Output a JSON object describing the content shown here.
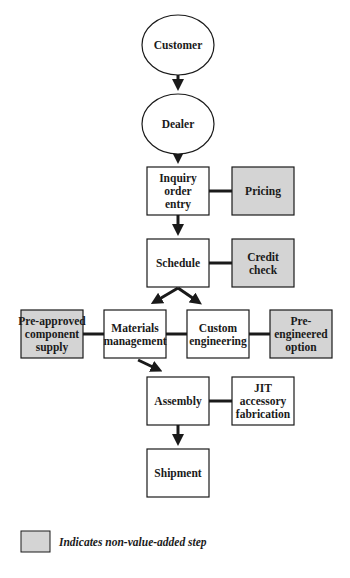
{
  "colors": {
    "process_fill": "#ffffff",
    "non_value_added_fill": "#d4d4d4",
    "stroke": "#1a1a1a"
  },
  "nodes": {
    "customer": {
      "lines": [
        "Customer"
      ],
      "shape": "ellipse",
      "non_value_added": false
    },
    "dealer": {
      "lines": [
        "Dealer"
      ],
      "shape": "ellipse",
      "non_value_added": false
    },
    "inquiry": {
      "lines": [
        "Inquiry",
        "order",
        "entry"
      ],
      "shape": "box",
      "non_value_added": false
    },
    "pricing": {
      "lines": [
        "Pricing"
      ],
      "shape": "box",
      "non_value_added": true
    },
    "schedule": {
      "lines": [
        "Schedule"
      ],
      "shape": "box",
      "non_value_added": false
    },
    "credit_check": {
      "lines": [
        "Credit",
        "check"
      ],
      "shape": "box",
      "non_value_added": true
    },
    "pre_approved": {
      "lines": [
        "Pre-approved",
        "component",
        "supply"
      ],
      "shape": "box",
      "non_value_added": true
    },
    "materials": {
      "lines": [
        "Materials",
        "management"
      ],
      "shape": "box",
      "non_value_added": false
    },
    "custom_engineering": {
      "lines": [
        "Custom",
        "engineering"
      ],
      "shape": "box",
      "non_value_added": false
    },
    "pre_engineered": {
      "lines": [
        "Pre-",
        "engineered",
        "option"
      ],
      "shape": "box",
      "non_value_added": true
    },
    "assembly": {
      "lines": [
        "Assembly"
      ],
      "shape": "box",
      "non_value_added": false
    },
    "jit": {
      "lines": [
        "JIT",
        "accessory",
        "fabrication"
      ],
      "shape": "box",
      "non_value_added": false
    },
    "shipment": {
      "lines": [
        "Shipment"
      ],
      "shape": "box",
      "non_value_added": false
    }
  },
  "edges": [
    {
      "from": "customer",
      "to": "dealer",
      "type": "arrow"
    },
    {
      "from": "dealer",
      "to": "inquiry",
      "type": "arrow"
    },
    {
      "from": "inquiry",
      "to": "schedule",
      "type": "arrow"
    },
    {
      "from": "schedule",
      "to": "materials",
      "type": "arrow"
    },
    {
      "from": "schedule",
      "to": "custom_engineering",
      "type": "arrow"
    },
    {
      "from": "materials",
      "to": "assembly",
      "type": "arrow"
    },
    {
      "from": "assembly",
      "to": "shipment",
      "type": "arrow"
    },
    {
      "from": "inquiry",
      "to": "pricing",
      "type": "line"
    },
    {
      "from": "schedule",
      "to": "credit_check",
      "type": "line"
    },
    {
      "from": "pre_approved",
      "to": "materials",
      "type": "line"
    },
    {
      "from": "materials",
      "to": "custom_engineering",
      "type": "line"
    },
    {
      "from": "custom_engineering",
      "to": "pre_engineered",
      "type": "line"
    },
    {
      "from": "assembly",
      "to": "jit",
      "type": "line"
    }
  ],
  "legend": {
    "label": "Indicates non-value-added step"
  }
}
